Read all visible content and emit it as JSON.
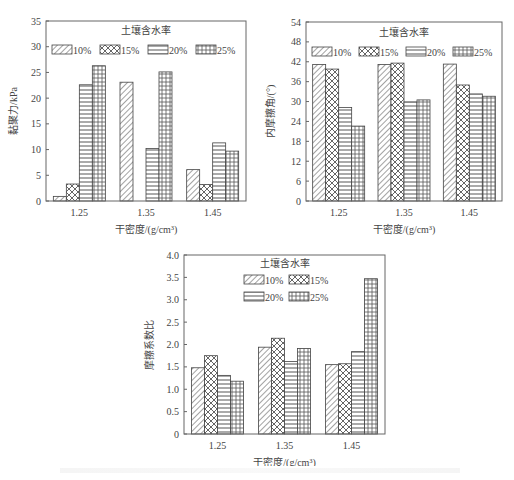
{
  "chart_data": [
    {
      "type": "bar",
      "title": "",
      "legend_title": "土壤含水率",
      "xlabel": "干密度/(g/cm³)",
      "ylabel": "黏聚力/kPa",
      "categories": [
        "1.25",
        "1.35",
        "1.45"
      ],
      "series": [
        {
          "name": "10%",
          "pattern": "diag",
          "values": [
            0.9,
            23.1,
            6.1
          ]
        },
        {
          "name": "15%",
          "pattern": "cross",
          "values": [
            3.3,
            0,
            3.2
          ]
        },
        {
          "name": "20%",
          "pattern": "hlines",
          "values": [
            22.6,
            10.2,
            11.3
          ]
        },
        {
          "name": "25%",
          "pattern": "grid",
          "values": [
            26.3,
            25.1,
            9.7
          ]
        }
      ],
      "ylim": [
        0,
        35
      ],
      "yticks": [
        0,
        5,
        10,
        15,
        20,
        25,
        30,
        35
      ],
      "legend_position": "top, single row",
      "grid": false
    },
    {
      "type": "bar",
      "title": "",
      "legend_title": "土壤含水率",
      "xlabel": "干密度/(g/cm³)",
      "ylabel": "内摩擦角/(°)",
      "categories": [
        "1.25",
        "1.35",
        "1.45"
      ],
      "series": [
        {
          "name": "10%",
          "pattern": "diag",
          "values": [
            41.2,
            41.2,
            41.3
          ]
        },
        {
          "name": "15%",
          "pattern": "cross",
          "values": [
            39.8,
            41.6,
            35.0
          ]
        },
        {
          "name": "20%",
          "pattern": "hlines",
          "values": [
            28.2,
            29.9,
            32.3
          ]
        },
        {
          "name": "25%",
          "pattern": "grid",
          "values": [
            22.6,
            30.5,
            31.6
          ]
        }
      ],
      "ylim": [
        0,
        54
      ],
      "yticks": [
        0,
        6,
        12,
        18,
        24,
        30,
        36,
        42,
        48,
        54
      ],
      "legend_position": "top, single row",
      "grid": false
    },
    {
      "type": "bar",
      "title": "",
      "legend_title": "土壤含水率",
      "xlabel": "干密度/(g/cm³)",
      "ylabel": "摩擦系数比",
      "categories": [
        "1.25",
        "1.35",
        "1.45"
      ],
      "series": [
        {
          "name": "10%",
          "pattern": "diag",
          "values": [
            1.48,
            1.94,
            1.55
          ]
        },
        {
          "name": "15%",
          "pattern": "cross",
          "values": [
            1.75,
            2.14,
            1.57
          ]
        },
        {
          "name": "20%",
          "pattern": "hlines",
          "values": [
            1.31,
            1.62,
            1.84
          ]
        },
        {
          "name": "25%",
          "pattern": "grid",
          "values": [
            1.18,
            1.91,
            3.47
          ]
        }
      ],
      "ylim": [
        0,
        4.0
      ],
      "yticks": [
        "0",
        "0.5",
        "1.0",
        "1.5",
        "2.0",
        "2.5",
        "3.0",
        "3.5",
        "4.0"
      ],
      "legend_position": "top, two rows",
      "grid": false
    }
  ]
}
